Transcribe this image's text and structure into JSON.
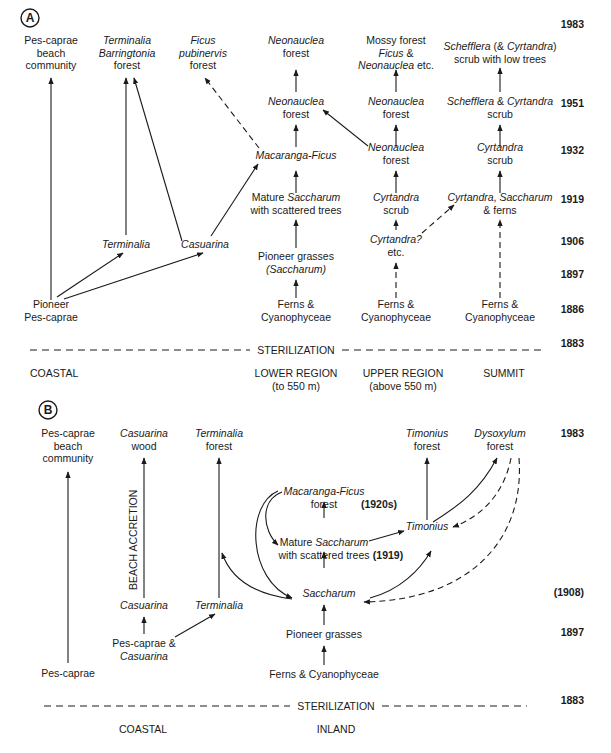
{
  "panels": [
    {
      "letter": "A",
      "years": [
        {
          "label": "1983",
          "y": 28
        },
        {
          "label": "1951",
          "y": 107
        },
        {
          "label": "1932",
          "y": 154
        },
        {
          "label": "1919",
          "y": 203
        },
        {
          "label": "1906",
          "y": 245
        },
        {
          "label": "1897",
          "y": 278
        },
        {
          "label": "1886",
          "y": 313
        },
        {
          "label": "1883",
          "y": 347
        }
      ],
      "divider_label": "STERILIZATION",
      "regions": [
        {
          "lines": [
            "COASTAL"
          ],
          "x": 30,
          "anchor": "start"
        },
        {
          "lines": [
            "LOWER REGION",
            "(to 550 m)"
          ],
          "x": 296,
          "anchor": "middle"
        },
        {
          "lines": [
            "UPPER REGION",
            "(above 550 m)"
          ],
          "x": 403,
          "anchor": "middle"
        },
        {
          "lines": [
            "SUMMIT"
          ],
          "x": 504,
          "anchor": "middle"
        }
      ],
      "nodes": [
        {
          "id": "a_pes_beach",
          "x": 51,
          "y": 44,
          "lines": [
            [
              [
                "Pes-caprae",
                0
              ]
            ],
            [
              [
                "beach",
                0
              ]
            ],
            [
              [
                "community",
                0
              ]
            ]
          ]
        },
        {
          "id": "a_term_barr",
          "x": 127,
          "y": 44,
          "lines": [
            [
              [
                "Terminalia",
                1
              ]
            ],
            [
              [
                "Barringtonia",
                1
              ]
            ],
            [
              [
                "forest",
                0
              ]
            ]
          ]
        },
        {
          "id": "a_ficus",
          "x": 203,
          "y": 44,
          "lines": [
            [
              [
                "Ficus",
                1
              ]
            ],
            [
              [
                "pubinervis",
                1
              ]
            ],
            [
              [
                "forest",
                0
              ]
            ]
          ]
        },
        {
          "id": "a_neo_1983_low",
          "x": 296,
          "y": 44,
          "lines": [
            [
              [
                "Neonauclea",
                1
              ]
            ],
            [
              [
                "forest",
                0
              ]
            ]
          ]
        },
        {
          "id": "a_mossy",
          "x": 396,
          "y": 44,
          "lines": [
            [
              [
                "Mossy forest",
                0
              ]
            ],
            [
              [
                "Ficus",
                1
              ],
              [
                " &",
                0
              ]
            ],
            [
              [
                "Neonauclea",
                1
              ],
              [
                " etc.",
                0
              ]
            ]
          ]
        },
        {
          "id": "a_schef_1983",
          "x": 500,
          "y": 50,
          "lines": [
            [
              [
                "Schefflera",
                1
              ],
              [
                " (& ",
                0
              ],
              [
                "Cyrtandra",
                1
              ],
              [
                ")",
                0
              ]
            ],
            [
              [
                "scrub with low trees",
                0
              ]
            ]
          ]
        },
        {
          "id": "a_neo_1951_low",
          "x": 296,
          "y": 105,
          "lines": [
            [
              [
                "Neonauclea",
                1
              ]
            ],
            [
              [
                "forest",
                0
              ]
            ]
          ]
        },
        {
          "id": "a_neo_1951_up",
          "x": 396,
          "y": 105,
          "lines": [
            [
              [
                "Neonauclea",
                1
              ]
            ],
            [
              [
                "forest",
                0
              ]
            ]
          ]
        },
        {
          "id": "a_schef_1951",
          "x": 500,
          "y": 105,
          "lines": [
            [
              [
                "Schefflera",
                1
              ],
              [
                " & ",
                0
              ],
              [
                "Cyrtandra",
                1
              ]
            ],
            [
              [
                "scrub",
                0
              ]
            ]
          ]
        },
        {
          "id": "a_macaranga",
          "x": 296,
          "y": 159,
          "lines": [
            [
              [
                "Macaranga-Ficus",
                1
              ]
            ]
          ]
        },
        {
          "id": "a_neo_1932_up",
          "x": 396,
          "y": 151,
          "lines": [
            [
              [
                "Neonauclea",
                1
              ]
            ],
            [
              [
                "forest",
                0
              ]
            ]
          ]
        },
        {
          "id": "a_cyrt_1932",
          "x": 500,
          "y": 151,
          "lines": [
            [
              [
                "Cyrtandra",
                1
              ]
            ],
            [
              [
                "scrub",
                0
              ]
            ]
          ]
        },
        {
          "id": "a_mature_sacch",
          "x": 296,
          "y": 201,
          "lines": [
            [
              [
                "Mature ",
                0
              ],
              [
                "Saccharum",
                1
              ]
            ],
            [
              [
                "with scattered trees",
                0
              ]
            ]
          ]
        },
        {
          "id": "a_cyrt_scrub_1919",
          "x": 396,
          "y": 201,
          "lines": [
            [
              [
                "Cyrtandra",
                1
              ]
            ],
            [
              [
                "scrub",
                0
              ]
            ]
          ]
        },
        {
          "id": "a_cyrt_sacch_ferns",
          "x": 500,
          "y": 201,
          "lines": [
            [
              [
                "Cyrtandra",
                1
              ],
              [
                ", ",
                0
              ],
              [
                "Saccharum",
                1
              ]
            ],
            [
              [
                "& ferns",
                0
              ]
            ]
          ]
        },
        {
          "id": "a_terminalia",
          "x": 126,
          "y": 248,
          "lines": [
            [
              [
                "Terminalia",
                1
              ]
            ]
          ]
        },
        {
          "id": "a_casuarina",
          "x": 205,
          "y": 248,
          "lines": [
            [
              [
                "Casuarina",
                1
              ]
            ]
          ]
        },
        {
          "id": "a_cyrt_q",
          "x": 396,
          "y": 243,
          "lines": [
            [
              [
                "Cyrtandra?",
                1
              ]
            ],
            [
              [
                "etc.",
                0
              ]
            ]
          ]
        },
        {
          "id": "a_pioneer_grass",
          "x": 296,
          "y": 260,
          "lines": [
            [
              [
                "Pioneer grasses",
                0
              ]
            ],
            [
              [
                "(Saccharum)",
                1
              ]
            ]
          ]
        },
        {
          "id": "a_pioneer_pes",
          "x": 51,
          "y": 308,
          "lines": [
            [
              [
                "Pioneer",
                0
              ]
            ],
            [
              [
                "Pes-caprae",
                0
              ]
            ]
          ]
        },
        {
          "id": "a_ferns_low",
          "x": 296,
          "y": 308,
          "lines": [
            [
              [
                "Ferns &",
                0
              ]
            ],
            [
              [
                "Cyanophyceae",
                0
              ]
            ]
          ]
        },
        {
          "id": "a_ferns_up",
          "x": 396,
          "y": 308,
          "lines": [
            [
              [
                "Ferns &",
                0
              ]
            ],
            [
              [
                "Cyanophyceae",
                0
              ]
            ]
          ]
        },
        {
          "id": "a_ferns_sum",
          "x": 500,
          "y": 308,
          "lines": [
            [
              [
                "Ferns &",
                0
              ]
            ],
            [
              [
                "Cyanophyceae",
                0
              ]
            ]
          ]
        }
      ],
      "edges": [
        {
          "d": "M51,300 L51,78",
          "dash": false
        },
        {
          "d": "M126,235 L126,78",
          "dash": false
        },
        {
          "d": "M182,241 L134,78",
          "dash": false
        },
        {
          "d": "M211,236 L258,164",
          "dash": false
        },
        {
          "d": "M57,297 L123,253",
          "dash": false
        },
        {
          "d": "M64,299 L203,253",
          "dash": false
        },
        {
          "d": "M259,148 L205,78",
          "dash": true
        },
        {
          "d": "M296,92 L296,70",
          "dash": false
        },
        {
          "d": "M296,147 L296,125",
          "dash": false
        },
        {
          "d": "M296,193 L296,171",
          "dash": false
        },
        {
          "d": "M296,248 L296,220",
          "dash": false
        },
        {
          "d": "M296,298 L296,280",
          "dash": false
        },
        {
          "d": "M368,146 L323,110",
          "dash": false
        },
        {
          "d": "M396,92 L396,70",
          "dash": false
        },
        {
          "d": "M396,147 L396,125",
          "dash": false
        },
        {
          "d": "M396,193 L396,171",
          "dash": false
        },
        {
          "d": "M396,230 L396,220",
          "dash": true
        },
        {
          "d": "M396,298 L396,263",
          "dash": true
        },
        {
          "d": "M422,233 L454,205",
          "dash": true
        },
        {
          "d": "M500,92 L500,68",
          "dash": false
        },
        {
          "d": "M500,147 L500,125",
          "dash": false
        },
        {
          "d": "M500,193 L500,171",
          "dash": false
        },
        {
          "d": "M500,298 L500,220",
          "dash": true
        }
      ],
      "divider": {
        "y": 350,
        "x1": 30,
        "x2": 545,
        "label_x": 296
      }
    },
    {
      "letter": "B",
      "years": [
        {
          "label": "1983",
          "y": 437
        },
        {
          "label": "(1908)",
          "y": 596
        },
        {
          "label": "1897",
          "y": 636
        },
        {
          "label": "1883",
          "y": 704
        }
      ],
      "divider_label": "STERILIZATION",
      "regions": [
        {
          "lines": [
            "COASTAL"
          ],
          "x": 143,
          "anchor": "middle"
        },
        {
          "lines": [
            "INLAND"
          ],
          "x": 336,
          "anchor": "middle"
        }
      ],
      "vertical_label": "BEACH ACCRETION",
      "nodes": [
        {
          "id": "b_pes_beach",
          "x": 68,
          "y": 437,
          "lines": [
            [
              [
                "Pes-caprae",
                0
              ]
            ],
            [
              [
                "beach",
                0
              ]
            ],
            [
              [
                "community",
                0
              ]
            ]
          ]
        },
        {
          "id": "b_cas_wood",
          "x": 144,
          "y": 437,
          "lines": [
            [
              [
                "Casuarina",
                1
              ]
            ],
            [
              [
                "wood",
                0
              ]
            ]
          ]
        },
        {
          "id": "b_term_forest",
          "x": 219,
          "y": 437,
          "lines": [
            [
              [
                "Terminalia",
                1
              ]
            ],
            [
              [
                "forest",
                0
              ]
            ]
          ]
        },
        {
          "id": "b_tim_forest",
          "x": 427,
          "y": 437,
          "lines": [
            [
              [
                "Timonius",
                1
              ]
            ],
            [
              [
                "forest",
                0
              ]
            ]
          ]
        },
        {
          "id": "b_dysox",
          "x": 500,
          "y": 437,
          "lines": [
            [
              [
                "Dysoxylum",
                1
              ]
            ],
            [
              [
                "forest",
                0
              ]
            ]
          ]
        },
        {
          "id": "b_macaranga",
          "x": 324,
          "y": 495,
          "lines": [
            [
              [
                "Macaranga-Ficus",
                1
              ]
            ],
            [
              [
                "forest",
                0
              ]
            ]
          ]
        },
        {
          "id": "b_tim",
          "x": 427,
          "y": 530,
          "lines": [
            [
              [
                "Timonius",
                1
              ]
            ]
          ]
        },
        {
          "id": "b_mature",
          "x": 324,
          "y": 546,
          "lines": [
            [
              [
                "Mature ",
                0
              ],
              [
                "Saccharum",
                1
              ]
            ],
            [
              [
                "with scattered trees",
                0
              ]
            ]
          ]
        },
        {
          "id": "b_sacch",
          "x": 329,
          "y": 597,
          "lines": [
            [
              [
                "Saccharum",
                1
              ]
            ]
          ]
        },
        {
          "id": "b_cas",
          "x": 144,
          "y": 609,
          "lines": [
            [
              [
                "Casuarina",
                1
              ]
            ]
          ]
        },
        {
          "id": "b_term",
          "x": 219,
          "y": 609,
          "lines": [
            [
              [
                "Terminalia",
                1
              ]
            ]
          ]
        },
        {
          "id": "b_pes_cas",
          "x": 144,
          "y": 647,
          "lines": [
            [
              [
                "Pes-caprae &",
                0
              ]
            ],
            [
              [
                "Casuarina",
                1
              ]
            ]
          ]
        },
        {
          "id": "b_pioneer",
          "x": 324,
          "y": 638,
          "lines": [
            [
              [
                "Pioneer grasses",
                0
              ]
            ]
          ]
        },
        {
          "id": "b_pes",
          "x": 68,
          "y": 677,
          "lines": [
            [
              [
                "Pes-caprae",
                0
              ]
            ]
          ]
        },
        {
          "id": "b_ferns",
          "x": 324,
          "y": 678,
          "lines": [
            [
              [
                "Ferns & Cyanophyceae",
                0
              ]
            ]
          ]
        }
      ],
      "annotations": [
        {
          "label": "(1920s)",
          "x": 379,
          "y": 508
        },
        {
          "label": "(1919)",
          "x": 388,
          "y": 559
        }
      ],
      "edges": [
        {
          "d": "M68,663 L68,472",
          "dash": false
        },
        {
          "d": "M144,598 L144,458",
          "dash": false
        },
        {
          "d": "M144,634 L144,617",
          "dash": false
        },
        {
          "d": "M175,637 L215,614",
          "dash": false
        },
        {
          "d": "M219,598 L219,458",
          "dash": false
        },
        {
          "d": "M324,518 L324,502",
          "dash": false
        },
        {
          "d": "M324,568 L324,552",
          "dash": false
        },
        {
          "d": "M324,625 L324,605",
          "dash": false
        },
        {
          "d": "M324,665 L324,646",
          "dash": false
        },
        {
          "d": "M369,541 L404,531",
          "dash": false
        },
        {
          "d": "M427,520 L427,458",
          "dash": false
        },
        {
          "d": "M433,522 C460,505 480,490 497,458",
          "dash": false
        },
        {
          "d": "M511,458 C505,490 485,515 453,527",
          "dash": true
        },
        {
          "d": "M519,458 C525,540 470,600 364,602",
          "dash": true
        },
        {
          "d": "M370,598 C400,590 420,570 431,551",
          "dash": false
        },
        {
          "d": "M282,492 C260,500 262,530 278,545",
          "dash": false
        },
        {
          "d": "M278,491 C245,505 248,580 292,598",
          "dash": false
        },
        {
          "d": "M292,599 C260,595 232,582 222,553",
          "dash": false
        }
      ],
      "divider": {
        "y": 706,
        "x1": 44,
        "x2": 527,
        "label_x": 336
      }
    }
  ]
}
